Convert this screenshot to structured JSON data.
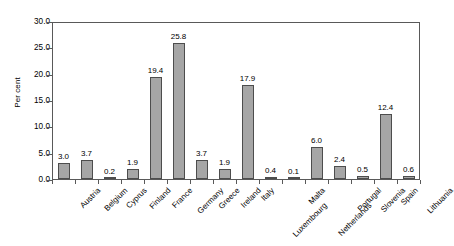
{
  "chart_data": {
    "type": "bar",
    "title": "",
    "subtitle": "",
    "xlabel": "",
    "ylabel": "Per cent",
    "ylim": [
      0.0,
      30.0
    ],
    "ytick_step": 5.0,
    "ytick_labels": [
      "30.0",
      "25.0",
      "20.0",
      "15.0",
      "10.0",
      "5.0",
      "0.0"
    ],
    "ytick_values": [
      30.0,
      25.0,
      20.0,
      15.0,
      10.0,
      5.0,
      0.0
    ],
    "grid": false,
    "legend": "none",
    "bar_color": "#a6a6a6",
    "bar_border_color": "#4d4d4d",
    "axis_color": "#595959",
    "categories": [
      "Austria",
      "Belgium",
      "Cyprus",
      "Finland",
      "France",
      "Germany",
      "Greece",
      "Ireland",
      "Italy",
      "Luxembourg",
      "Malta",
      "Netherlands",
      "Portugal",
      "Slovenia",
      "Spain",
      "Lithuania"
    ],
    "values": [
      3.0,
      3.7,
      0.2,
      1.9,
      19.4,
      25.8,
      3.7,
      1.9,
      17.9,
      0.4,
      0.1,
      6.0,
      2.4,
      0.5,
      12.4,
      0.6
    ],
    "value_labels": [
      "3.0",
      "3.7",
      "0.2",
      "1.9",
      "19.4",
      "25.8",
      "3.7",
      "1.9",
      "17.9",
      "0.4",
      "0.1",
      "6.0",
      "2.4",
      "0.5",
      "12.4",
      "0.6"
    ],
    "staggered_labels": [
      "Luxembourg",
      "Netherlands"
    ]
  }
}
